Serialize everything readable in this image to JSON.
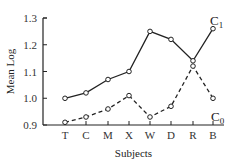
{
  "chart_data": {
    "type": "line",
    "title": "",
    "xlabel": "Subjects",
    "ylabel": "Mean Log",
    "categories": [
      "T",
      "C",
      "M",
      "X",
      "W",
      "D",
      "R",
      "B"
    ],
    "ylim": [
      0.9,
      1.3
    ],
    "yticks": [
      "0.9",
      "1.0",
      "1.1",
      "1.2",
      "1.3"
    ],
    "grid": false,
    "legend_position": "inline-labels-right",
    "series": [
      {
        "name": "C1",
        "label_main": "C",
        "label_sub": "1",
        "style": "solid",
        "marker": "open-circle",
        "values": [
          1.0,
          1.02,
          1.07,
          1.1,
          1.25,
          1.22,
          1.14,
          1.26
        ]
      },
      {
        "name": "C0",
        "label_main": "C",
        "label_sub": "0",
        "style": "dashed",
        "marker": "open-circle",
        "values": [
          0.91,
          0.93,
          0.96,
          1.01,
          0.93,
          0.97,
          1.12,
          1.0
        ]
      }
    ]
  },
  "colors": {
    "line": "#222222",
    "axis": "#222222",
    "background": "#ffffff"
  }
}
